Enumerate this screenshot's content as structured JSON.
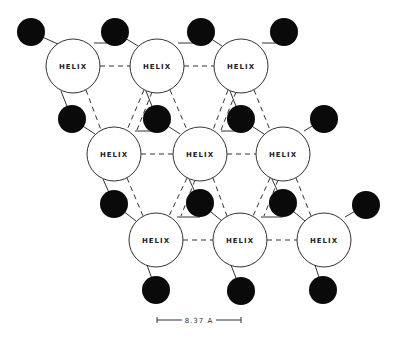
{
  "diagram": {
    "helix_label": "HELIX",
    "helix_radius": 27,
    "ion_radius": 14,
    "helices": [
      {
        "id": "h1",
        "x": 73,
        "y": 66,
        "label": "HELIX"
      },
      {
        "id": "h2",
        "x": 157,
        "y": 66,
        "label": "HELIX"
      },
      {
        "id": "h3",
        "x": 241,
        "y": 66,
        "label": "HELIX"
      },
      {
        "id": "h4",
        "x": 114,
        "y": 154,
        "label": "HELIX"
      },
      {
        "id": "h5",
        "x": 200,
        "y": 154,
        "label": "HELIX"
      },
      {
        "id": "h6",
        "x": 283,
        "y": 154,
        "label": "HELIX"
      },
      {
        "id": "h7",
        "x": 156,
        "y": 240,
        "label": "HELIX"
      },
      {
        "id": "h8",
        "x": 240,
        "y": 240,
        "label": "HELIX"
      },
      {
        "id": "h9",
        "x": 324,
        "y": 240,
        "label": "HELIX"
      }
    ],
    "ions": [
      {
        "x": 31,
        "y": 32
      },
      {
        "x": 115,
        "y": 32
      },
      {
        "x": 201,
        "y": 32
      },
      {
        "x": 284,
        "y": 32
      },
      {
        "x": 72,
        "y": 119
      },
      {
        "x": 157,
        "y": 119
      },
      {
        "x": 241,
        "y": 119
      },
      {
        "x": 324,
        "y": 119
      },
      {
        "x": 114,
        "y": 204
      },
      {
        "x": 200,
        "y": 203
      },
      {
        "x": 283,
        "y": 203
      },
      {
        "x": 366,
        "y": 205
      },
      {
        "x": 156,
        "y": 290
      },
      {
        "x": 241,
        "y": 291
      },
      {
        "x": 323,
        "y": 290
      }
    ],
    "solid_bonds": [
      [
        31,
        32,
        58,
        44
      ],
      [
        94,
        43,
        115,
        43
      ],
      [
        115,
        32,
        138,
        46
      ],
      [
        178,
        43,
        201,
        43
      ],
      [
        201,
        32,
        222,
        46
      ],
      [
        262,
        43,
        284,
        43
      ],
      [
        61,
        91,
        72,
        119
      ],
      [
        72,
        119,
        95,
        134
      ],
      [
        135,
        131,
        157,
        131
      ],
      [
        146,
        91,
        157,
        119
      ],
      [
        157,
        119,
        180,
        134
      ],
      [
        221,
        131,
        241,
        131
      ],
      [
        230,
        91,
        241,
        119
      ],
      [
        241,
        119,
        264,
        134
      ],
      [
        304,
        131,
        324,
        119
      ],
      [
        103,
        179,
        114,
        204
      ],
      [
        114,
        204,
        136,
        221
      ],
      [
        177,
        217,
        200,
        217
      ],
      [
        189,
        179,
        200,
        203
      ],
      [
        200,
        203,
        222,
        221
      ],
      [
        261,
        217,
        283,
        217
      ],
      [
        272,
        179,
        283,
        203
      ],
      [
        283,
        203,
        305,
        221
      ],
      [
        345,
        217,
        366,
        205
      ],
      [
        147,
        265,
        156,
        290
      ],
      [
        231,
        265,
        241,
        291
      ],
      [
        315,
        265,
        323,
        290
      ]
    ],
    "dashed_bonds": [
      [
        100,
        66,
        130,
        66
      ],
      [
        184,
        66,
        214,
        66
      ],
      [
        141,
        154,
        173,
        154
      ],
      [
        227,
        154,
        256,
        154
      ],
      [
        183,
        240,
        213,
        240
      ],
      [
        267,
        240,
        297,
        240
      ],
      [
        86,
        90,
        101,
        130
      ],
      [
        144,
        90,
        127,
        130
      ],
      [
        170,
        90,
        187,
        130
      ],
      [
        228,
        90,
        213,
        130
      ],
      [
        254,
        90,
        270,
        130
      ],
      [
        152,
        92,
        137,
        130
      ],
      [
        236,
        92,
        221,
        130
      ],
      [
        127,
        178,
        143,
        216
      ],
      [
        187,
        178,
        169,
        216
      ],
      [
        213,
        178,
        227,
        216
      ],
      [
        270,
        178,
        253,
        216
      ],
      [
        296,
        178,
        311,
        216
      ],
      [
        195,
        180,
        181,
        216
      ],
      [
        278,
        180,
        264,
        216
      ]
    ],
    "scale_bar": {
      "label": "8.37 A",
      "x1": 157,
      "x2": 241,
      "y": 320
    }
  }
}
